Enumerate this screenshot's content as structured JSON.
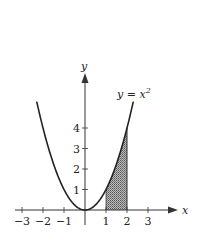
{
  "chart_data": {
    "type": "line",
    "title": "",
    "curve_label": "y = x²",
    "curve_label_base": "y = x",
    "curve_label_exp": "2",
    "function": "y = x^2",
    "xlabel": "x",
    "ylabel": "y",
    "x_ticks": [
      -3,
      -2,
      -1,
      1,
      2,
      3
    ],
    "x_tick_labels": [
      "−3",
      "−2",
      "−1",
      "1",
      "2",
      "3"
    ],
    "y_ticks": [
      1,
      2,
      3,
      4
    ],
    "y_tick_labels": [
      "1",
      "2",
      "3",
      "4"
    ],
    "xlim": [
      -3.3,
      4.4
    ],
    "ylim": [
      0,
      5.1
    ],
    "curve_domain": [
      -2.3,
      2.3
    ],
    "shaded_region": {
      "from_x": 1,
      "to_x": 2,
      "under": "y = x^2",
      "pattern": "stippled"
    },
    "grid": false,
    "legend": false
  }
}
